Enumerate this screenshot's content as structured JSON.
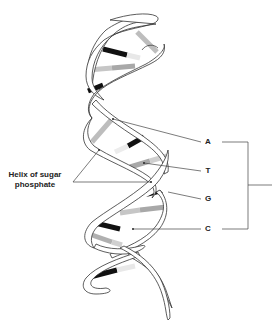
{
  "diagram": {
    "labels": {
      "helix": "Helix of sugar phosphate",
      "helix_line1": "Helix of sugar",
      "helix_line2": "phosphate",
      "base_a": "A",
      "base_t": "T",
      "base_g": "G",
      "base_c": "C"
    },
    "colors": {
      "outline": "#333333",
      "dark_base": "#111111",
      "light_base": "#b5b5b5",
      "ribbon_fill": "#ffffff",
      "leader_line": "#444444"
    }
  }
}
